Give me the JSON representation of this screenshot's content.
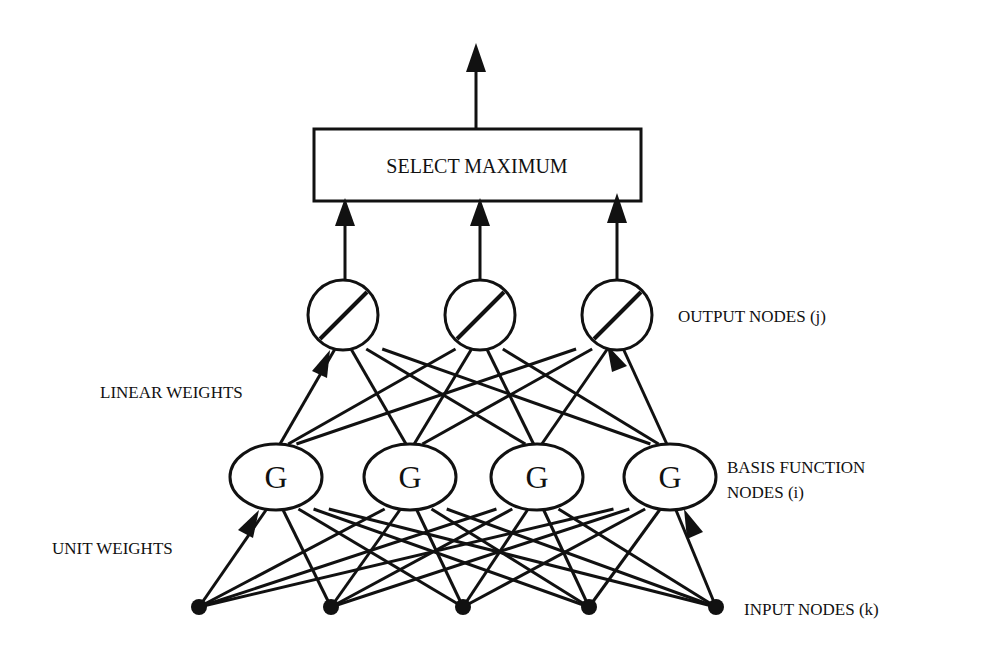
{
  "diagram": {
    "type": "rbf-network",
    "stroke_color": "#111111",
    "background": "#ffffff",
    "select_box": {
      "label": "SELECT MAXIMUM"
    },
    "labels": {
      "output_nodes": "OUTPUT NODES (j)",
      "linear_weights": "LINEAR WEIGHTS",
      "basis_line1": "BASIS FUNCTION",
      "basis_line2": "NODES (i)",
      "unit_weights": "UNIT WEIGHTS",
      "input_nodes": "INPUT NODES (k)"
    },
    "basis_node_symbol": "G",
    "output_nodes": [
      {
        "id": "j1",
        "x": 343,
        "y": 315
      },
      {
        "id": "j2",
        "x": 480,
        "y": 315
      },
      {
        "id": "j3",
        "x": 617,
        "y": 315
      }
    ],
    "basis_nodes": [
      {
        "id": "i1",
        "x": 276,
        "y": 477
      },
      {
        "id": "i2",
        "x": 410,
        "y": 477
      },
      {
        "id": "i3",
        "x": 537,
        "y": 477
      },
      {
        "id": "i4",
        "x": 670,
        "y": 477
      }
    ],
    "input_nodes": [
      {
        "id": "k1",
        "x": 199,
        "y": 607
      },
      {
        "id": "k2",
        "x": 331,
        "y": 607
      },
      {
        "id": "k3",
        "x": 463,
        "y": 607
      },
      {
        "id": "k4",
        "x": 589,
        "y": 607
      },
      {
        "id": "k5",
        "x": 716,
        "y": 607
      }
    ]
  }
}
